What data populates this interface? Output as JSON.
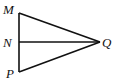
{
  "diagram": {
    "type": "geometry",
    "points": {
      "M": {
        "label": "M",
        "x": 19,
        "y": 13
      },
      "N": {
        "label": "N",
        "x": 19,
        "y": 42
      },
      "P": {
        "label": "P",
        "x": 19,
        "y": 72
      },
      "Q": {
        "label": "Q",
        "x": 100,
        "y": 42
      }
    },
    "segments": [
      {
        "from": "M",
        "to": "P"
      },
      {
        "from": "M",
        "to": "Q"
      },
      {
        "from": "N",
        "to": "Q"
      },
      {
        "from": "P",
        "to": "Q"
      }
    ],
    "labels": {
      "M": "M",
      "N": "N",
      "P": "P",
      "Q": "Q"
    },
    "colors": {
      "line": "#111111",
      "background": "#ffffff"
    }
  }
}
